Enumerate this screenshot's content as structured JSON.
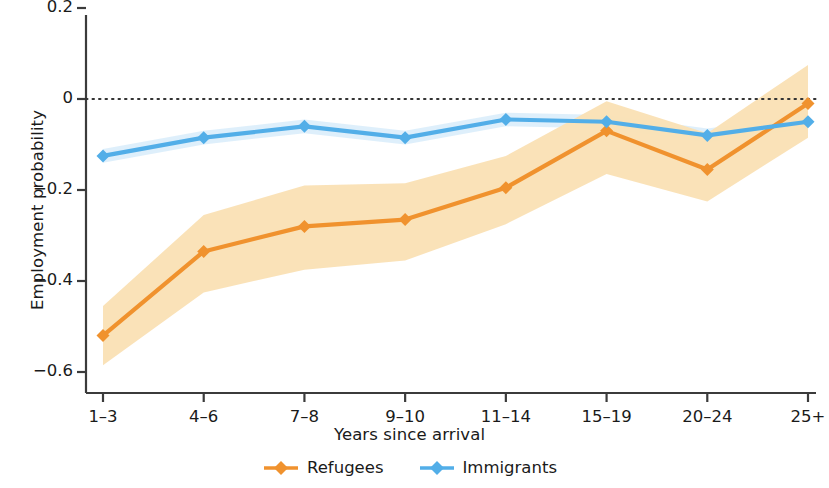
{
  "chart_data": {
    "type": "line",
    "title": "",
    "xlabel": "Years since arrival",
    "ylabel": "Employment probability",
    "categories": [
      "1–3",
      "4–6",
      "7–8",
      "9–10",
      "11–14",
      "15–19",
      "20–24",
      "25+"
    ],
    "ytick_labels": [
      "0.2",
      "0",
      "−0.2",
      "−0.4",
      "−0.6"
    ],
    "ytick_values": [
      0.2,
      0,
      -0.2,
      -0.4,
      -0.6
    ],
    "ylim": [
      -0.64,
      0.22
    ],
    "grid": false,
    "reference_line": {
      "y": 0,
      "style": "dotted",
      "color": "#333333"
    },
    "legend_position": "bottom-center",
    "series": [
      {
        "name": "Refugees",
        "color": "#F0922E",
        "marker": "diamond",
        "values": [
          -0.52,
          -0.335,
          -0.28,
          -0.265,
          -0.195,
          -0.07,
          -0.155,
          -0.01
        ],
        "band_color": "#FAE0B4",
        "ci_lower": [
          -0.585,
          -0.425,
          -0.375,
          -0.355,
          -0.275,
          -0.165,
          -0.225,
          -0.085
        ],
        "ci_upper": [
          -0.455,
          -0.255,
          -0.19,
          -0.185,
          -0.125,
          -0.005,
          -0.075,
          0.075
        ]
      },
      {
        "name": "Immigrants",
        "color": "#52AEE8",
        "marker": "diamond",
        "values": [
          -0.125,
          -0.085,
          -0.06,
          -0.085,
          -0.045,
          -0.05,
          -0.08,
          -0.05
        ],
        "band_color": "#DCEEFB",
        "ci_lower": [
          -0.14,
          -0.1,
          -0.075,
          -0.1,
          -0.06,
          -0.065,
          -0.095,
          -0.065
        ],
        "ci_upper": [
          -0.11,
          -0.07,
          -0.045,
          -0.07,
          -0.03,
          -0.035,
          -0.065,
          -0.035
        ]
      }
    ]
  },
  "legend": {
    "items": [
      {
        "label": "Refugees",
        "color": "#F0922E"
      },
      {
        "label": "Immigrants",
        "color": "#52AEE8"
      }
    ]
  }
}
